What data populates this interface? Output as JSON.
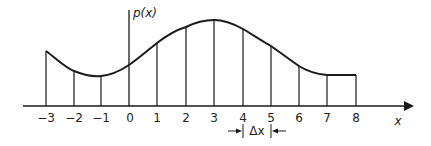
{
  "diagram": {
    "y_axis_label": "p(x)",
    "x_axis_label": "x",
    "delta_label": "Δx",
    "tick_labels": [
      "−3",
      "−2",
      "−1",
      "0",
      "1",
      "2",
      "3",
      "4",
      "5",
      "6",
      "7",
      "8"
    ],
    "x_values": [
      -3,
      -2,
      -1,
      0,
      1,
      2,
      3,
      4,
      5,
      6,
      7,
      8
    ],
    "curve_heights_relative": [
      0.64,
      0.42,
      0.35,
      0.48,
      0.73,
      0.9,
      1.0,
      0.9,
      0.69,
      0.46,
      0.37,
      0.36
    ],
    "delta_interval": [
      4,
      5
    ]
  }
}
